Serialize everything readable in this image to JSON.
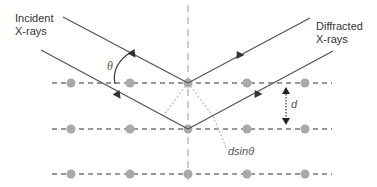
{
  "diagram": {
    "labels": {
      "incident_line1": "Incident",
      "incident_line2": "X-rays",
      "diffracted_line1": "Diffracted",
      "diffracted_line2": "X-rays",
      "theta": "θ",
      "d": "d",
      "path_diff": "dsinθ"
    },
    "lattice": {
      "planes_y": [
        83,
        129,
        174
      ],
      "atoms_x": [
        71,
        130,
        188,
        247,
        305
      ],
      "normal_x": 188
    },
    "colors": {
      "ray": "#555555",
      "atom": "#a9a9a9",
      "plane": "#333333",
      "normal": "#999999",
      "construction": "#bbbbbb"
    }
  }
}
